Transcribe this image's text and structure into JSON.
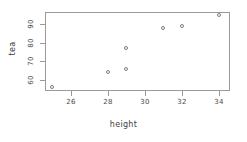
{
  "chart_data": {
    "type": "scatter",
    "title": "",
    "xlabel": "height",
    "ylabel": "tea",
    "xlim": [
      24.6,
      34.6
    ],
    "ylim": [
      54.0,
      96.5
    ],
    "grid": false,
    "legend": null,
    "xticks": [
      26,
      28,
      30,
      32,
      34
    ],
    "yticks": [
      60,
      70,
      80,
      90
    ],
    "xticklabels": [
      "26",
      "28",
      "30",
      "32",
      "34"
    ],
    "yticklabels": [
      "60",
      "70",
      "80",
      "90"
    ],
    "marker": "open-circle",
    "marker_color": "#7d7d7d",
    "points": [
      {
        "x": 25,
        "y": 56
      },
      {
        "x": 28,
        "y": 64
      },
      {
        "x": 29,
        "y": 66
      },
      {
        "x": 29,
        "y": 77
      },
      {
        "x": 31,
        "y": 88
      },
      {
        "x": 32,
        "y": 89
      },
      {
        "x": 34,
        "y": 95
      }
    ],
    "x": [
      25,
      28,
      29,
      29,
      31,
      32,
      34
    ],
    "y": [
      56,
      64,
      66,
      77,
      88,
      89,
      95
    ]
  },
  "colors": {
    "axis": "#9a9a9a",
    "text": "#3d3d3d",
    "marker": "#7d7d7d",
    "background": "#ffffff"
  }
}
